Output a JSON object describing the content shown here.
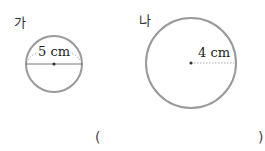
{
  "figures": [
    {
      "label": "가",
      "measure_text": "5 cm",
      "measure_type": "diameter"
    },
    {
      "label": "나",
      "measure_text": "4 cm",
      "measure_type": "radius"
    }
  ],
  "answer": {
    "open": "(",
    "close": ")"
  }
}
